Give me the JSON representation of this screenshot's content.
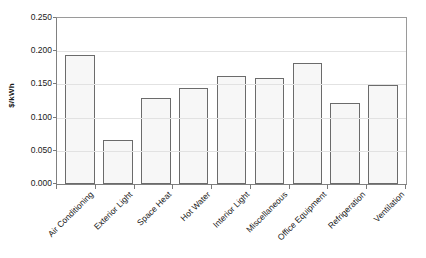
{
  "chart_data": {
    "type": "bar",
    "title": "",
    "xlabel": "",
    "ylabel": "$/kWh",
    "ylim": [
      0,
      0.25
    ],
    "ytick_labels": [
      "0.250",
      "0.200",
      "0.150",
      "0.100",
      "0.050",
      "0.000"
    ],
    "ytick_values": [
      0.25,
      0.2,
      0.15,
      0.1,
      0.05,
      0
    ],
    "grid": true,
    "legend": "none",
    "categories": [
      "Air Conditioning",
      "Exterior Light",
      "Space Heat",
      "Hot Water",
      "Interior Light",
      "Miscellaneous",
      "Office Equipment",
      "Refrigeration",
      "Ventilation"
    ],
    "values": [
      0.195,
      0.067,
      0.13,
      0.144,
      0.162,
      0.159,
      0.182,
      0.122,
      0.149
    ],
    "colors": {
      "bar_fill": "#f7f7f7",
      "bar_border": "#6b6b6b",
      "gridline": "#e2e2e2",
      "axis": "#808080",
      "text": "#1a1a1a",
      "background": "#ffffff"
    }
  }
}
